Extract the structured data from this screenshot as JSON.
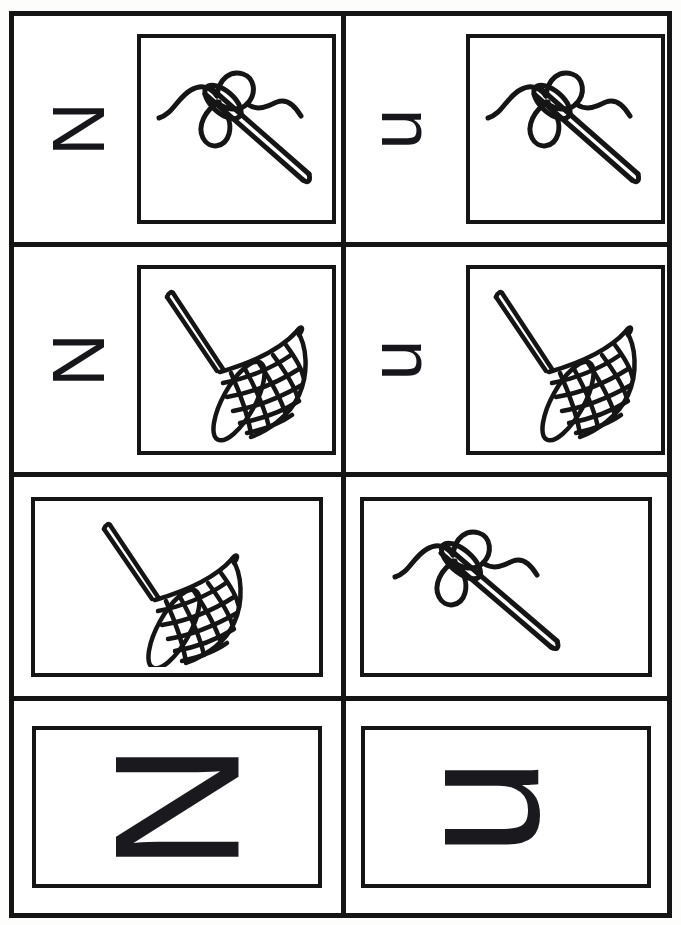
{
  "worksheet": {
    "title": "Letter N n tracing and picture cards",
    "letters": {
      "uppercase": "N",
      "lowercase": "n"
    },
    "orientation_note": "letters rotated 90 degrees",
    "colors": {
      "ink": "#151515",
      "paper": "#ffffff"
    }
  },
  "grid": {
    "columns": 2,
    "rows": 4,
    "cells": [
      {
        "id": "r1c1",
        "letter": "N",
        "letter_case": "uppercase",
        "picture": "needle-and-thread",
        "picture_label": "needle",
        "has_letter": true,
        "frame": "square"
      },
      {
        "id": "r1c2",
        "letter": "n",
        "letter_case": "lowercase",
        "picture": "needle-and-thread",
        "picture_label": "needle",
        "has_letter": true,
        "frame": "square"
      },
      {
        "id": "r2c1",
        "letter": "N",
        "letter_case": "uppercase",
        "picture": "butterfly-net",
        "picture_label": "net",
        "has_letter": true,
        "frame": "square"
      },
      {
        "id": "r2c2",
        "letter": "n",
        "letter_case": "lowercase",
        "picture": "butterfly-net",
        "picture_label": "net",
        "has_letter": true,
        "frame": "square"
      },
      {
        "id": "r3c1",
        "letter": "",
        "letter_case": "none",
        "picture": "butterfly-net",
        "picture_label": "net",
        "has_letter": false,
        "frame": "wide"
      },
      {
        "id": "r3c2",
        "letter": "",
        "letter_case": "none",
        "picture": "needle-and-thread",
        "picture_label": "needle",
        "has_letter": false,
        "frame": "wide"
      },
      {
        "id": "r4c1",
        "letter": "N",
        "letter_case": "uppercase",
        "picture": "none",
        "picture_label": "",
        "has_letter": true,
        "frame": "big"
      },
      {
        "id": "r4c2",
        "letter": "n",
        "letter_case": "lowercase",
        "picture": "none",
        "picture_label": "",
        "has_letter": true,
        "frame": "big"
      }
    ]
  }
}
